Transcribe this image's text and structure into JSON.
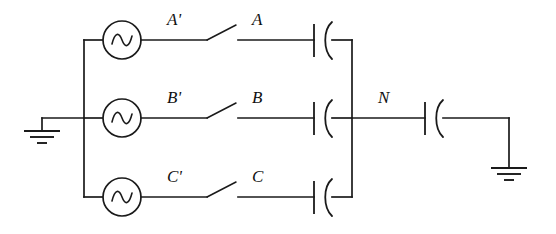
{
  "diagram": {
    "background_color": "#ffffff",
    "line_color": "#1a1a1a",
    "phases": [
      {
        "id": "a",
        "source_label": "A'",
        "line_label": "A",
        "source_icon": "ac-source-icon",
        "switch_icon": "open-switch-icon",
        "capacitor_icon": "capacitor-icon",
        "row_y": 40
      },
      {
        "id": "b",
        "source_label": "B'",
        "line_label": "B",
        "source_icon": "ac-source-icon",
        "switch_icon": "open-switch-icon",
        "capacitor_icon": "capacitor-icon",
        "row_y": 118
      },
      {
        "id": "c",
        "source_label": "C'",
        "line_label": "C",
        "source_icon": "ac-source-icon",
        "switch_icon": "open-switch-icon",
        "capacitor_icon": "capacitor-icon",
        "row_y": 197
      }
    ],
    "neutral": {
      "label": "N",
      "capacitor_icon": "capacitor-icon",
      "row_y": 118
    },
    "grounds": [
      {
        "id": "left-ground",
        "icon": "ground-icon",
        "bars": 3
      },
      {
        "id": "right-ground",
        "icon": "ground-icon",
        "bars": 3
      }
    ]
  }
}
